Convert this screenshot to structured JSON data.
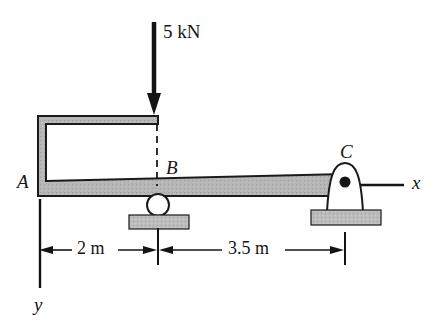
{
  "figure": {
    "labels": {
      "force": "5 kN",
      "point_a": "A",
      "point_b": "B",
      "point_c": "C",
      "axis_x": "x",
      "axis_y": "y"
    },
    "dimensions": [
      {
        "label": "2 m",
        "from": "A",
        "to": "B"
      },
      {
        "label": "3.5 m",
        "from": "B",
        "to": "C"
      }
    ],
    "icons": {
      "load_arrow": "down-arrow-icon",
      "roller_support": "roller-support-icon",
      "pin_support": "pin-support-icon",
      "pin_center": "pin-dot-icon",
      "ground_plate_b": "ground-plate-icon",
      "ground_plate_c": "ground-plate-icon",
      "projection_line": "dashed-projection-line-icon",
      "axis_x_line": "axis-line-icon",
      "axis_y_line": "axis-line-icon"
    },
    "colors": {
      "outline": "#1a1a1a",
      "beam_fill": "#b4b4b4",
      "plate_fill": "#b9b9b9",
      "support_fill": "#ffffff",
      "background": "#ffffff"
    },
    "geometry": {
      "beam_left_x": 38,
      "point_b_x": 158,
      "point_c_x": 345,
      "beam_axis_y": 188,
      "load_arrow_top_y": 22,
      "load_arrow_tip_y": 113,
      "dimension_line_y": 250
    }
  }
}
